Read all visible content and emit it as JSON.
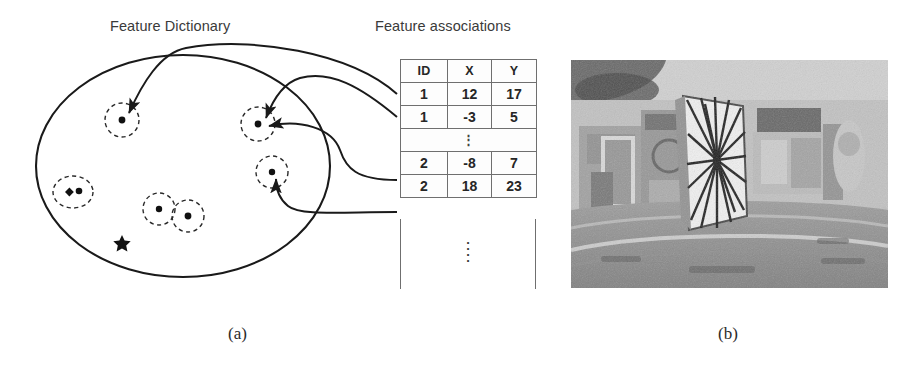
{
  "figure": {
    "panel_a": {
      "caption": "(a)",
      "dictionary_title": "Feature Dictionary",
      "associations_title": "Feature associations",
      "dictionary": {
        "shape": "ellipse",
        "landmark_marker": "star",
        "feature_clusters": [
          {
            "id": "cluster-top-left",
            "dots": 1,
            "cx": 122,
            "cy": 120,
            "r": 17
          },
          {
            "id": "cluster-top-right",
            "dots": 1,
            "cx": 258,
            "cy": 124,
            "r": 17
          },
          {
            "id": "cluster-mid-right",
            "dots": 1,
            "cx": 272,
            "cy": 172,
            "r": 16
          },
          {
            "id": "cluster-left",
            "dots": 2,
            "cx": 73,
            "cy": 192,
            "r": 18
          },
          {
            "id": "cluster-bottom-a",
            "dots": 1,
            "cx": 159,
            "cy": 209,
            "r": 16
          },
          {
            "id": "cluster-bottom-b",
            "dots": 1,
            "cx": 188,
            "cy": 216,
            "r": 16
          }
        ]
      },
      "table": {
        "headers": [
          "ID",
          "X",
          "Y"
        ],
        "rows": [
          [
            "1",
            "12",
            "17"
          ],
          [
            "1",
            "-3",
            "5"
          ],
          [
            "⋮",
            "",
            ""
          ],
          [
            "2",
            "-8",
            "7"
          ],
          [
            "2",
            "18",
            "23"
          ]
        ],
        "ellipsis_row_index": 2,
        "ellipsis_glyph": "⋮",
        "tail_ellipsis": "⋮"
      },
      "association_arrows": [
        {
          "from_row": "1 | 12 | 17",
          "to_cluster": "cluster-top-left"
        },
        {
          "from_row": "1 | -3 | 5",
          "to_cluster": "cluster-top-right"
        },
        {
          "from_row": "2 | -8 | 7",
          "to_cluster": "cluster-top-right"
        },
        {
          "from_row": "2 | 18 | 23",
          "to_cluster": "cluster-mid-right"
        }
      ]
    },
    "panel_b": {
      "caption": "(b)",
      "image_description": "grayscale fisheye photo of an indoor room with a white panel showing radiating tracked feature lines"
    }
  },
  "colors": {
    "ink": "#1a1a1a",
    "label_gray": "#3a3a3a",
    "table_border": "#6f6f6f",
    "page_background": "#ffffff"
  }
}
